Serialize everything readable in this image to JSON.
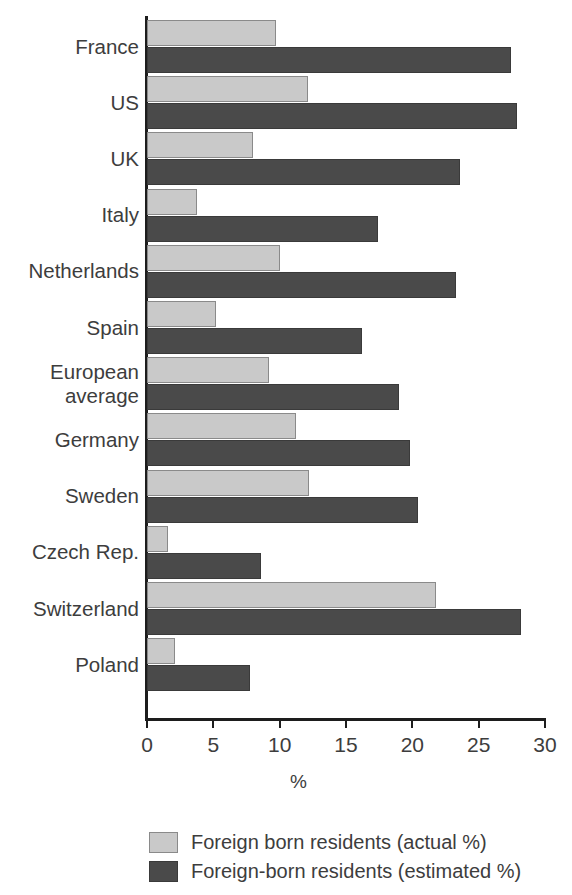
{
  "chart_data": {
    "type": "bar",
    "orientation": "horizontal",
    "title": "",
    "subtitle": "",
    "xlabel": "%",
    "ylabel": "",
    "xlim": [
      0,
      30
    ],
    "xticks": [
      0,
      5,
      10,
      15,
      20,
      25,
      30
    ],
    "xtick_labels": [
      "0",
      "5",
      "10",
      "15",
      "20",
      "25",
      "30"
    ],
    "grid": false,
    "legend_position": "bottom",
    "categories": [
      "France",
      "US",
      "UK",
      "Italy",
      "Netherlands",
      "Spain",
      "European\naverage",
      "Germany",
      "Sweden",
      "Czech Rep.",
      "Switzerland",
      "Poland"
    ],
    "series": [
      {
        "name": "Foreign born residents (actual %)",
        "color": "#c9c9c9",
        "values": [
          9.7,
          12.1,
          8.0,
          3.8,
          10.0,
          5.2,
          9.2,
          11.2,
          12.2,
          1.6,
          21.8,
          2.1
        ]
      },
      {
        "name": "Foreign-born residents (estimated %)",
        "color": "#4a4a4a",
        "values": [
          27.4,
          27.9,
          23.6,
          17.4,
          23.3,
          16.2,
          19.0,
          19.8,
          20.4,
          8.6,
          28.2,
          7.8
        ]
      }
    ]
  },
  "legend": {
    "items": [
      {
        "label": "Foreign born residents (actual %)",
        "swatch": "actual"
      },
      {
        "label": "Foreign-born residents (estimated %)",
        "swatch": "estimated"
      }
    ]
  },
  "colors": {
    "actual": "#c9c9c9",
    "estimated": "#4a4a4a",
    "axis": "#1d1d1d",
    "text": "#3d3d3d",
    "background": "#ffffff"
  }
}
